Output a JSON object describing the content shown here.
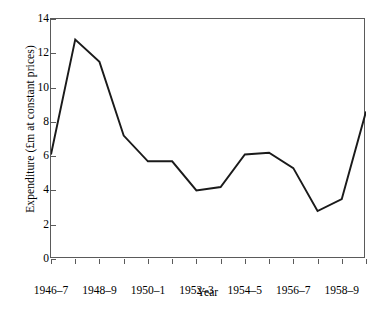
{
  "chart_data": {
    "type": "line",
    "title": "",
    "xlabel": "Year",
    "ylabel": "Expenditure (£m at constant prices)",
    "xlim": [
      0,
      13
    ],
    "ylim": [
      0,
      14
    ],
    "ytick_values": [
      0,
      2,
      4,
      6,
      8,
      10,
      12,
      14
    ],
    "ytick_labels": [
      "0",
      "2",
      "4",
      "6",
      "8",
      "10",
      "12",
      "14"
    ],
    "grid": false,
    "legend": null,
    "x": [
      "1946-7",
      "1947-8",
      "1948-9",
      "1949-50",
      "1950-1",
      "1951-2",
      "1952-3",
      "1953-4",
      "1954-5",
      "1955-6",
      "1956-7",
      "1957-8",
      "1958-9",
      "1959-60"
    ],
    "xtick_labels": [
      "1946–7",
      "1948–9",
      "1950–1",
      "1952–3",
      "1954–5",
      "1956–7",
      "1958–9"
    ],
    "xtick_indices": [
      0,
      2,
      4,
      6,
      8,
      10,
      12
    ],
    "values": [
      6.1,
      12.8,
      11.5,
      7.2,
      5.7,
      5.7,
      4.0,
      4.2,
      6.1,
      6.2,
      5.3,
      2.8,
      3.5,
      8.6
    ],
    "series_color": "#1a1a1a",
    "axis_color": "#5a5a5a",
    "background": "#ffffff"
  }
}
